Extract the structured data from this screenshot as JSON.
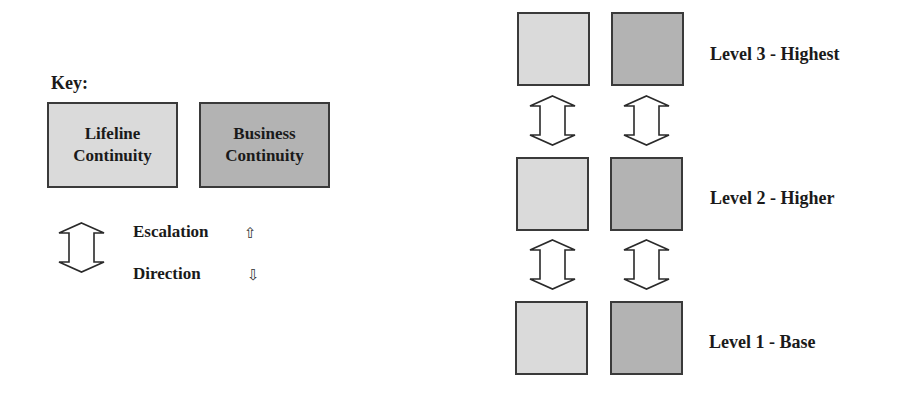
{
  "key": {
    "title": "Key:",
    "items": [
      {
        "line1": "Lifeline",
        "line2": "Continuity",
        "color": "#dadada"
      },
      {
        "line1": "Business",
        "line2": "Continuity",
        "color": "#b3b3b3"
      }
    ],
    "arrow_legend": {
      "line1": "Escalation",
      "line1_glyph": "⇧",
      "line2": "Direction",
      "line2_glyph": "⇩"
    }
  },
  "levels": [
    {
      "label": "Level 3 - Highest"
    },
    {
      "label": "Level 2 - Higher"
    },
    {
      "label": "Level 1 - Base"
    }
  ],
  "colors": {
    "lifeline": "#dadada",
    "business": "#b3b3b3",
    "border": "#3a3a3a"
  }
}
